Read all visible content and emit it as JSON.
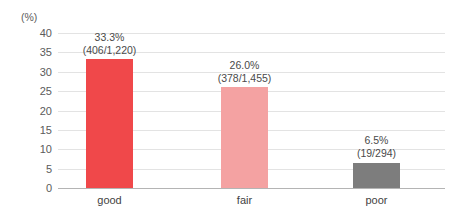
{
  "chart_data": {
    "type": "bar",
    "title": "",
    "xlabel": "",
    "ylabel": "(%)",
    "ylim": [
      0,
      40
    ],
    "grid": true,
    "legend": "none",
    "yticks": [
      "40",
      "35",
      "30",
      "25",
      "20",
      "15",
      "10",
      "5",
      "0"
    ],
    "ytick_values": [
      40,
      35,
      30,
      25,
      20,
      15,
      10,
      5,
      0
    ],
    "categories": [
      "good",
      "fair",
      "poor"
    ],
    "values": [
      33.3,
      26.0,
      6.5
    ],
    "bar_colors": [
      "#f0484a",
      "#f4a2a2",
      "#7d7d7d"
    ],
    "data_labels": [
      {
        "pct": "33.3%",
        "fraction": "(406/1,220)",
        "numerator": 406,
        "denominator": 1220
      },
      {
        "pct": "26.0%",
        "fraction": "(378/1,455)",
        "numerator": 378,
        "denominator": 1455
      },
      {
        "pct": "6.5%",
        "fraction": "(19/294)",
        "numerator": 19,
        "denominator": 294
      }
    ]
  },
  "axis": {
    "unit_caption": "(%)"
  },
  "colors": {
    "bar_good": "#f0484a",
    "bar_fair": "#f4a2a2",
    "bar_poor": "#7d7d7d",
    "gridline": "#e3e3e3",
    "baseline": "#b4b4b4",
    "tick_text": "#5b5b5b",
    "label_text": "#4a4a4a",
    "category_text": "#3f3f3f"
  }
}
